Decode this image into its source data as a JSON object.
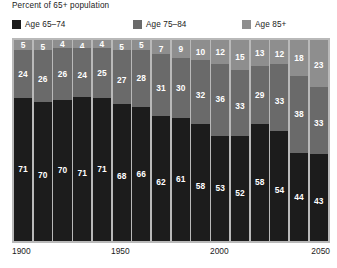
{
  "chart_data": {
    "type": "bar",
    "subtype": "stacked-100-percent",
    "title": "Percent of 65+ population",
    "xlabel": "",
    "ylabel": "",
    "ylim": [
      0,
      100
    ],
    "grid": false,
    "legend_position": "top",
    "orientation": "vertical",
    "categories": [
      "1900",
      "1910",
      "1920",
      "1930",
      "1940",
      "1950",
      "1960",
      "1970",
      "1980",
      "1990",
      "2000",
      "2010",
      "2020",
      "2030",
      "2040",
      "2050"
    ],
    "axis_tick_labels": [
      "1900",
      "1950",
      "2000",
      "2050"
    ],
    "series": [
      {
        "name": "Age 65–74",
        "color": "#1c1c1c",
        "values": [
          71,
          70,
          70,
          71,
          71,
          68,
          66,
          62,
          61,
          58,
          53,
          52,
          58,
          54,
          44,
          43
        ]
      },
      {
        "name": "Age 75–84",
        "color": "#6a6a6a",
        "values": [
          24,
          26,
          26,
          24,
          25,
          27,
          28,
          31,
          30,
          32,
          36,
          33,
          29,
          33,
          38,
          33
        ]
      },
      {
        "name": "Age 85+",
        "color": "#8e8e8e",
        "values": [
          5,
          5,
          4,
          4,
          4,
          5,
          5,
          7,
          9,
          10,
          12,
          15,
          13,
          12,
          18,
          23
        ]
      }
    ]
  },
  "legend": {
    "items": [
      {
        "label": "Age 65–74",
        "color": "#1c1c1c"
      },
      {
        "label": "Age 75–84",
        "color": "#6a6a6a"
      },
      {
        "label": "Age 85+",
        "color": "#8e8e8e"
      }
    ]
  },
  "plot": {
    "background_color": "#b9b9b9",
    "separator_color": "#ffffff"
  }
}
